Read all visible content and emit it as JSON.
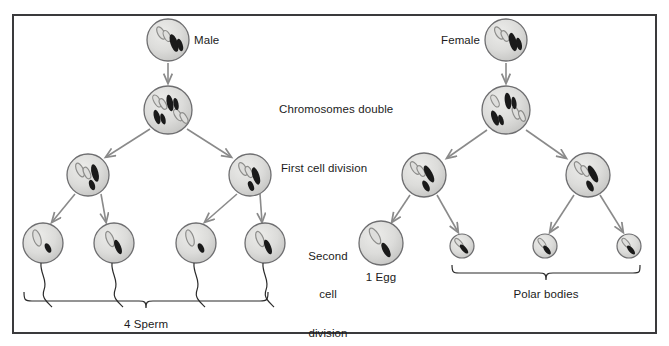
{
  "diagram": {
    "frame_color": "#3a3a3c",
    "arrow_color": "#8a8a8a",
    "cell_fill": "#d8d8d6",
    "cell_stroke": "#6e6e70",
    "chromosome_dark": "#1a1a1a",
    "chromosome_light": "#a9a9a7"
  },
  "labels": {
    "male": "Male",
    "female": "Female",
    "chromosomes_double": "Chromosomes double",
    "first_cell_division": "First cell division",
    "second_cell_division_line1": "Second",
    "second_cell_division_line2": "cell",
    "second_cell_division_line3": "division",
    "one_egg": "1 Egg",
    "four_sperm": "4 Sperm",
    "polar_bodies": "Polar bodies"
  },
  "cells": {
    "male_parent": {
      "cx": 168,
      "cy": 40,
      "r": 21,
      "kind": "parent",
      "name": "male-parent-cell"
    },
    "male_doubled": {
      "cx": 168,
      "cy": 110,
      "r": 24,
      "kind": "doubled",
      "name": "male-doubled-cell"
    },
    "male_sec_left": {
      "cx": 88,
      "cy": 175,
      "r": 21,
      "kind": "secondary",
      "name": "male-secondary-cell-left"
    },
    "male_sec_right": {
      "cx": 250,
      "cy": 175,
      "r": 21,
      "kind": "secondary",
      "name": "male-secondary-cell-right"
    },
    "sperm1": {
      "cx": 43,
      "cy": 243,
      "r": 20,
      "name": "sperm-cell-1"
    },
    "sperm2": {
      "cx": 114,
      "cy": 243,
      "r": 20,
      "name": "sperm-cell-2"
    },
    "sperm3": {
      "cx": 196,
      "cy": 243,
      "r": 20,
      "name": "sperm-cell-3"
    },
    "sperm4": {
      "cx": 265,
      "cy": 243,
      "r": 20,
      "name": "sperm-cell-4"
    },
    "female_parent": {
      "cx": 506,
      "cy": 40,
      "r": 21,
      "kind": "parent",
      "name": "female-parent-cell"
    },
    "female_doubled": {
      "cx": 506,
      "cy": 110,
      "r": 24,
      "kind": "doubled",
      "name": "female-doubled-cell"
    },
    "female_sec_left": {
      "cx": 424,
      "cy": 175,
      "r": 22,
      "kind": "secondary",
      "name": "female-secondary-cell-left"
    },
    "female_sec_right": {
      "cx": 588,
      "cy": 175,
      "r": 22,
      "kind": "secondary",
      "name": "female-secondary-cell-right"
    },
    "egg": {
      "cx": 381,
      "cy": 243,
      "r": 22,
      "name": "egg-cell"
    },
    "polar1": {
      "cx": 462,
      "cy": 246,
      "r": 12,
      "name": "polar-body-1"
    },
    "polar2": {
      "cx": 545,
      "cy": 246,
      "r": 12,
      "name": "polar-body-2"
    },
    "polar3": {
      "cx": 629,
      "cy": 246,
      "r": 12,
      "name": "polar-body-3"
    }
  },
  "braces": {
    "sperm": {
      "x1": 24,
      "x2": 268,
      "y": 300,
      "label_x": 146,
      "label_y": 318
    },
    "polar": {
      "x1": 452,
      "x2": 640,
      "y": 272,
      "label_x": 546,
      "label_y": 290
    }
  }
}
